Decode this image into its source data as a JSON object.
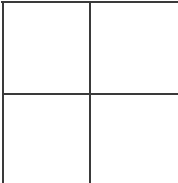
{
  "grid": {
    "rows": 2,
    "columns": 2,
    "line_color": "#3a3a3a",
    "background": "#ffffff",
    "cells": [
      {
        "row": 1,
        "col": 1,
        "label": ""
      },
      {
        "row": 1,
        "col": 2,
        "label": ""
      },
      {
        "row": 2,
        "col": 1,
        "label": ""
      },
      {
        "row": 2,
        "col": 2,
        "label": ""
      }
    ]
  }
}
